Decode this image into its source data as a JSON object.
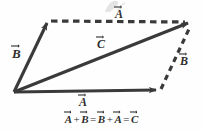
{
  "figure": {
    "background_color": "#fefefe",
    "stroke_color": "#3a3a3a",
    "text_color": "#2e2e2e",
    "width": 203,
    "height": 131
  },
  "labels": {
    "b_left": "B",
    "a_top": "A",
    "c_middle": "C",
    "a_bottom": "A",
    "b_right": "B"
  },
  "equation": {
    "full_text": "A + B = B + A = C",
    "terms": {
      "t1": "A",
      "op1": "+",
      "t2": "B",
      "op2": "=",
      "t3": "B",
      "op3": "+",
      "t4": "A",
      "op4": "=",
      "t5": "C"
    }
  },
  "geometry": {
    "origin": {
      "x": 14,
      "y": 92
    },
    "vector_a_solid": {
      "from": {
        "x": 14,
        "y": 92
      },
      "to": {
        "x": 161,
        "y": 90
      },
      "style": "solid",
      "label": "A"
    },
    "vector_b_solid": {
      "from": {
        "x": 14,
        "y": 92
      },
      "to": {
        "x": 48,
        "y": 20
      },
      "style": "solid",
      "label": "B"
    },
    "vector_c_solid": {
      "from": {
        "x": 14,
        "y": 92
      },
      "to": {
        "x": 193,
        "y": 21
      },
      "style": "solid",
      "label": "C"
    },
    "vector_a_dashed": {
      "from": {
        "x": 50,
        "y": 21
      },
      "to": {
        "x": 190,
        "y": 22
      },
      "style": "dashed",
      "label": "A"
    },
    "vector_b_dashed": {
      "from": {
        "x": 161,
        "y": 89
      },
      "to": {
        "x": 191,
        "y": 25
      },
      "style": "dashed",
      "label": "B"
    }
  },
  "artifacts": {
    "smudge_note": "faint grey scan smudge above top A label",
    "smudge_color": "#c9c9c9"
  }
}
